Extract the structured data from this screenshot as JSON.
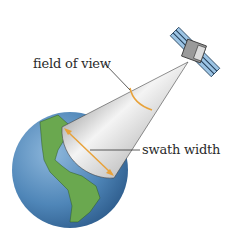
{
  "diagram": {
    "labels": {
      "field_of_view": "field of view",
      "swath_width": "swath width"
    },
    "components": [
      "satellite",
      "sensor-cone",
      "earth"
    ],
    "colors": {
      "ocean": "#4f86b8",
      "land": "#6aa84f",
      "arrow": "#e8a23a",
      "solar_panel": "#9cc4e4",
      "satellite_body": "#9a9a9a"
    }
  }
}
